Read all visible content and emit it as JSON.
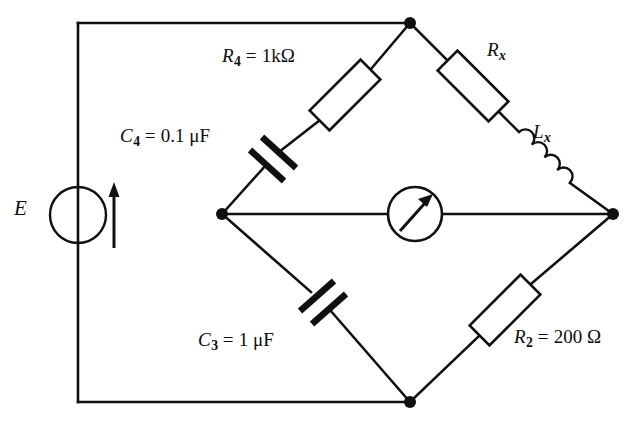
{
  "diagram": {
    "type": "circuit-schematic",
    "line_color": "#101010",
    "background_color": "#ffffff"
  },
  "source": {
    "name": "ac-voltage-source",
    "label": "E",
    "symbol": "circle-with-arrow",
    "arrow_direction": "up"
  },
  "detector": {
    "name": "galvanometer",
    "symbol": "circle-with-pointer-arrow",
    "label": ""
  },
  "components": {
    "r4": {
      "designator": "R",
      "subscript": "4",
      "value": "1 kΩ",
      "label": "R4 = 1kΩ",
      "symbol": "resistor",
      "arm": "top-left"
    },
    "c4": {
      "designator": "C",
      "subscript": "4",
      "value": "0.1 μF",
      "label": "C4 = 0.1 μF",
      "symbol": "capacitor",
      "arm": "top-left"
    },
    "rx": {
      "designator": "R",
      "subscript": "x",
      "value": "",
      "label": "Rx",
      "symbol": "resistor",
      "arm": "top-right"
    },
    "lx": {
      "designator": "L",
      "subscript": "x",
      "value": "",
      "label": "Lx",
      "symbol": "inductor",
      "arm": "top-right"
    },
    "c3": {
      "designator": "C",
      "subscript": "3",
      "value": "1 μF",
      "label": "C3 = 1 μF",
      "symbol": "capacitor",
      "arm": "bottom-left"
    },
    "r2": {
      "designator": "R",
      "subscript": "2",
      "value": "200 Ω",
      "label": "R2 = 200 Ω",
      "symbol": "resistor",
      "arm": "bottom-right"
    }
  },
  "text": {
    "equals": "=",
    "ohm": "Ω",
    "micro_farad": "μF",
    "r4_value": "1kΩ",
    "c4_value": "0.1 μF",
    "c3_value": "1 μF",
    "r2_value": "200 Ω",
    "r_symbol": "R",
    "c_symbol": "C",
    "l_symbol": "L",
    "e_symbol": "E",
    "sub_4": "4",
    "sub_3": "3",
    "sub_2": "2",
    "sub_x": "x"
  },
  "nodes": [
    {
      "name": "top-node",
      "x": 410,
      "y": 23
    },
    {
      "name": "left-node",
      "x": 222,
      "y": 214
    },
    {
      "name": "right-node",
      "x": 613,
      "y": 214
    },
    {
      "name": "bottom-node",
      "x": 410,
      "y": 402
    }
  ]
}
